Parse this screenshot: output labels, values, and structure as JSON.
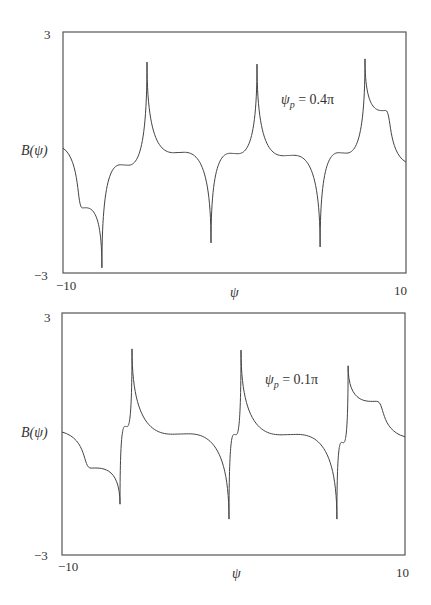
{
  "chart_data": [
    {
      "type": "line",
      "title": "",
      "xlabel": "ψ",
      "ylabel": "B(ψ)",
      "xlim": [
        -10,
        10
      ],
      "ylim": [
        -3,
        3
      ],
      "x_ticks": [
        "-10",
        "10"
      ],
      "y_ticks": [
        "3",
        "-3"
      ],
      "grid": false,
      "annotation": "ψp = 0.4π",
      "annotation_parts": {
        "base": "ψ",
        "sub": "p",
        "rest": " = 0.4π"
      },
      "series": [
        {
          "name": "B(ψ), ψp = 0.4π",
          "features": [
            {
              "x": -10.0,
              "y": 0.11,
              "kind": "start"
            },
            {
              "x": -7.73,
              "y": -2.87,
              "kind": "cusp-min"
            },
            {
              "x": -5.1,
              "y": 2.25,
              "kind": "cusp-max"
            },
            {
              "x": -1.37,
              "y": -2.25,
              "kind": "cusp-min"
            },
            {
              "x": 1.31,
              "y": 2.2,
              "kind": "cusp-max"
            },
            {
              "x": 4.99,
              "y": -2.35,
              "kind": "cusp-min"
            },
            {
              "x": 7.61,
              "y": 2.33,
              "kind": "cusp-max"
            },
            {
              "x": 10.0,
              "y": -0.24,
              "kind": "end"
            }
          ]
        }
      ]
    },
    {
      "type": "line",
      "title": "",
      "xlabel": "ψ",
      "ylabel": "B(ψ)",
      "xlim": [
        -10,
        10
      ],
      "ylim": [
        -3,
        3
      ],
      "x_ticks": [
        "-10",
        "10"
      ],
      "y_ticks": [
        "3",
        "-3"
      ],
      "grid": false,
      "annotation": "ψp = 0.1π",
      "annotation_parts": {
        "base": "ψ",
        "sub": "p",
        "rest": " = 0.1π"
      },
      "series": [
        {
          "name": "B(ψ), ψp = 0.1π",
          "features": [
            {
              "x": -10.0,
              "y": 0.05,
              "kind": "start"
            },
            {
              "x": -6.62,
              "y": -1.74,
              "kind": "cusp-min"
            },
            {
              "x": -5.92,
              "y": 2.11,
              "kind": "cusp-max"
            },
            {
              "x": -0.26,
              "y": -2.11,
              "kind": "cusp-min"
            },
            {
              "x": 0.44,
              "y": 2.08,
              "kind": "cusp-max"
            },
            {
              "x": 6.03,
              "y": -2.11,
              "kind": "cusp-min"
            },
            {
              "x": 6.68,
              "y": 1.69,
              "kind": "cusp-max"
            },
            {
              "x": 10.0,
              "y": -0.07,
              "kind": "end"
            }
          ]
        }
      ]
    }
  ],
  "labels": {
    "top": {
      "y_max": "3",
      "y_min": "−3",
      "x_min": "−10",
      "x_max": "10",
      "xlabel": "ψ",
      "ylabel": "B(ψ)",
      "ann_base": "ψ",
      "ann_sub": "p",
      "ann_rest": " = 0.4π"
    },
    "bottom": {
      "y_max": "3",
      "y_min": "−3",
      "x_min": "−10",
      "x_max": "10",
      "xlabel": "ψ",
      "ylabel": "B(ψ)",
      "ann_base": "ψ",
      "ann_sub": "p",
      "ann_rest": " = 0.1π"
    }
  }
}
